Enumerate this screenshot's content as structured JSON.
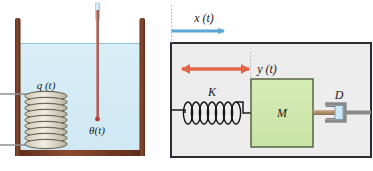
{
  "figure": {
    "title": "",
    "panels": [
      {
        "id": "thermal-system",
        "name": "liquid-tank-thermal-system",
        "labels": {
          "heater_input": "q (t)",
          "temperature_output": "θ(t)"
        },
        "colors": {
          "tank_wall": "#7a3b24",
          "liquid_fill": "#d7ecf5",
          "liquid_surface": "#8fc4dd",
          "coil_stroke": "#6f6a57",
          "coil_fill": "#e8e4d6",
          "lead_wire": "#8a8a8a",
          "thermometer_glass": "#a8d4e8",
          "thermometer_fluid": "#a85c52",
          "thermometer_bulb": "#c0392b"
        },
        "elements": {
          "tank": "open-top rectangular tank",
          "liquid": "light blue liquid",
          "heating_coil": "helical resistance heater coil",
          "thermometer": "vertical thermometer probe"
        }
      },
      {
        "id": "mechanical-system",
        "name": "mass-spring-damper-system",
        "labels": {
          "input_displacement": "x (t)",
          "output_displacement": "y (t)",
          "spring": "K",
          "mass": "M",
          "damper": "D"
        },
        "colors": {
          "frame_border": "#2b2b33",
          "frame_fill": "#ececed",
          "mass_fill": "#cfe6b0",
          "mass_border": "#4e5b3b",
          "spring_stroke": "#1c1c1c",
          "input_arrow": "#5aa8d8",
          "output_arrow": "#e2654a",
          "damper_body": "#8a8a8a",
          "damper_piston": "#cfe8f5",
          "damper_rod": "#b59a77",
          "reference_line": "#b9b9b9"
        },
        "elements": {
          "spring": "coil spring K",
          "mass": "mass block M",
          "damper": "dashpot damper D",
          "x_arrow": "blue single-headed arrow pointing right",
          "y_arrow": "red double-headed arrow"
        }
      }
    ]
  }
}
